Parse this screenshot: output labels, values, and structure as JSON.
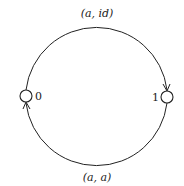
{
  "diagram": {
    "type": "state-transition",
    "nodes": [
      {
        "id": "0",
        "label": "0"
      },
      {
        "id": "1",
        "label": "1"
      }
    ],
    "edges": [
      {
        "from": "0",
        "to": "1",
        "label": "(a, id)",
        "position": "top"
      },
      {
        "from": "1",
        "to": "0",
        "label": "(a, a)",
        "position": "bottom"
      }
    ],
    "colors": {
      "stroke": "#222222",
      "background": "#ffffff"
    }
  }
}
